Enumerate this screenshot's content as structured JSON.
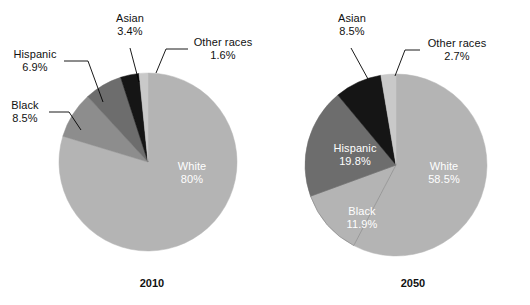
{
  "figure": {
    "title": "",
    "background": "#ffffff",
    "width": 530,
    "height": 305
  },
  "palette": {
    "white_slice": "#b4b4b4",
    "black_slice_2010": "#8d8d8d",
    "black_slice_2050": "#b4b4b4",
    "hispanic_slice": "#6d6d6d",
    "asian_slice": "#151515",
    "other_slice": "#c9c9c9",
    "leader_line": "#000000",
    "text_dark": "#111111",
    "text_light": "#ffffff"
  },
  "charts": [
    {
      "id": "chart-2010",
      "year_label": "2010",
      "slices": [
        {
          "name": "White",
          "percent_label": "80%",
          "value": 80.0
        },
        {
          "name": "Other races",
          "percent_label": "1.6%",
          "value": 1.6
        },
        {
          "name": "Asian",
          "percent_label": "3.4%",
          "value": 3.4
        },
        {
          "name": "Hispanic",
          "percent_label": "6.9%",
          "value": 6.9
        },
        {
          "name": "Black",
          "percent_label": "8.5%",
          "value": 8.5
        }
      ]
    },
    {
      "id": "chart-2050",
      "year_label": "2050",
      "slices": [
        {
          "name": "White",
          "percent_label": "58.5%",
          "value": 58.5
        },
        {
          "name": "Other races",
          "percent_label": "2.7%",
          "value": 2.7
        },
        {
          "name": "Asian",
          "percent_label": "8.5%",
          "value": 8.5
        },
        {
          "name": "Hispanic",
          "percent_label": "19.8%",
          "value": 19.8
        },
        {
          "name": "Black",
          "percent_label": "11.9%",
          "value": 11.9
        }
      ]
    }
  ],
  "labels_2010": {
    "asian_name": "Asian",
    "asian_pct": "3.4%",
    "other_name": "Other races",
    "other_pct": "1.6%",
    "hispanic_name": "Hispanic",
    "hispanic_pct": "6.9%",
    "black_name": "Black",
    "black_pct": "8.5%",
    "white_name": "White",
    "white_pct": "80%",
    "year": "2010"
  },
  "labels_2050": {
    "asian_name": "Asian",
    "asian_pct": "8.5%",
    "other_name": "Other races",
    "other_pct": "2.7%",
    "hispanic_name": "Hispanic",
    "hispanic_pct": "19.8%",
    "black_name": "Black",
    "black_pct": "11.9%",
    "white_name": "White",
    "white_pct": "58.5%",
    "year": "2050"
  },
  "chart_data": [
    {
      "type": "pie",
      "title": "2010",
      "categories": [
        "White",
        "Other races",
        "Asian",
        "Hispanic",
        "Black"
      ],
      "values": [
        80.0,
        1.6,
        3.4,
        6.9,
        8.5
      ],
      "labels": [
        "80%",
        "1.6%",
        "3.4%",
        "6.9%",
        "8.5%"
      ],
      "colors": [
        "#b4b4b4",
        "#c9c9c9",
        "#151515",
        "#6d6d6d",
        "#8d8d8d"
      ],
      "start_angle_deg": 0,
      "direction": "clockwise",
      "legend": "none",
      "grid": false,
      "units": "percent"
    },
    {
      "type": "pie",
      "title": "2050",
      "categories": [
        "White",
        "Other races",
        "Asian",
        "Hispanic",
        "Black"
      ],
      "values": [
        58.5,
        2.7,
        8.5,
        19.8,
        11.9
      ],
      "labels": [
        "58.5%",
        "2.7%",
        "8.5%",
        "19.8%",
        "11.9%"
      ],
      "colors": [
        "#b4b4b4",
        "#c9c9c9",
        "#151515",
        "#6d6d6d",
        "#b4b4b4"
      ],
      "start_angle_deg": 0,
      "direction": "clockwise",
      "legend": "none",
      "grid": false,
      "units": "percent"
    }
  ]
}
